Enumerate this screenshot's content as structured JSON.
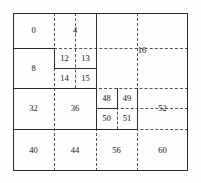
{
  "figure": {
    "bounds": {
      "x": 13,
      "y": 13,
      "width": 175,
      "height": 158
    },
    "colors": {
      "solid_line": "#2b2b2b",
      "dashed_line": "#555555",
      "background": "#fdfdfd",
      "label": "#161616"
    }
  },
  "cells": [
    {
      "label": "0",
      "x": 13,
      "y": 13,
      "w": 41,
      "h": 35
    },
    {
      "label": "4",
      "x": 54,
      "y": 13,
      "w": 42,
      "h": 35
    },
    {
      "label": "8",
      "x": 13,
      "y": 48,
      "w": 41,
      "h": 40
    },
    {
      "label": "12",
      "x": 54,
      "y": 48,
      "w": 21,
      "h": 20
    },
    {
      "label": "13",
      "x": 75,
      "y": 48,
      "w": 21,
      "h": 20
    },
    {
      "label": "14",
      "x": 54,
      "y": 68,
      "w": 21,
      "h": 20
    },
    {
      "label": "15",
      "x": 75,
      "y": 68,
      "w": 21,
      "h": 20
    },
    {
      "label": "16",
      "x": 96,
      "y": 13,
      "w": 92,
      "h": 75
    },
    {
      "label": "32",
      "x": 13,
      "y": 88,
      "w": 41,
      "h": 41
    },
    {
      "label": "36",
      "x": 54,
      "y": 88,
      "w": 42,
      "h": 41
    },
    {
      "label": "48",
      "x": 96,
      "y": 88,
      "w": 21,
      "h": 20
    },
    {
      "label": "49",
      "x": 117,
      "y": 88,
      "w": 20,
      "h": 20
    },
    {
      "label": "50",
      "x": 96,
      "y": 108,
      "w": 21,
      "h": 21
    },
    {
      "label": "51",
      "x": 117,
      "y": 108,
      "w": 20,
      "h": 21
    },
    {
      "label": "52",
      "x": 137,
      "y": 88,
      "w": 51,
      "h": 41
    },
    {
      "label": "40",
      "x": 13,
      "y": 129,
      "w": 41,
      "h": 42
    },
    {
      "label": "44",
      "x": 54,
      "y": 129,
      "w": 42,
      "h": 42
    },
    {
      "label": "56",
      "x": 96,
      "y": 129,
      "w": 41,
      "h": 42
    },
    {
      "label": "60",
      "x": 137,
      "y": 129,
      "w": 51,
      "h": 42
    }
  ],
  "dashed_lines": [
    {
      "name": "v-dash-x54-top",
      "orient": "v",
      "x": 54,
      "y": 13,
      "len": 158
    },
    {
      "name": "v-dash-x96-full",
      "orient": "v",
      "x": 96,
      "y": 13,
      "len": 158
    },
    {
      "name": "v-dash-x137-full",
      "orient": "v",
      "x": 137,
      "y": 13,
      "len": 158
    },
    {
      "name": "v-dash-x75-upper",
      "orient": "v",
      "x": 75,
      "y": 13,
      "len": 75
    },
    {
      "name": "v-dash-x117-mid",
      "orient": "v",
      "x": 117,
      "y": 88,
      "len": 41
    },
    {
      "name": "h-dash-y48-right",
      "orient": "h",
      "x": 54,
      "y": 48,
      "len": 134
    },
    {
      "name": "h-dash-y68-mid",
      "orient": "h",
      "x": 54,
      "y": 68,
      "len": 42
    },
    {
      "name": "h-dash-y88-full",
      "orient": "h",
      "x": 13,
      "y": 88,
      "len": 175
    },
    {
      "name": "h-dash-y108-mid",
      "orient": "h",
      "x": 96,
      "y": 108,
      "len": 92
    },
    {
      "name": "h-dash-y129-right",
      "orient": "h",
      "x": 96,
      "y": 129,
      "len": 92
    }
  ],
  "solid_lines": [
    {
      "name": "h-solid-y48-left",
      "orient": "h",
      "x": 13,
      "y": 48,
      "len": 41
    },
    {
      "name": "h-solid-y68-1215",
      "orient": "h",
      "x": 54,
      "y": 68,
      "len": 42
    },
    {
      "name": "h-solid-y88-left",
      "orient": "h",
      "x": 13,
      "y": 88,
      "len": 83
    },
    {
      "name": "h-solid-y108-4850",
      "orient": "h",
      "x": 96,
      "y": 108,
      "len": 21
    },
    {
      "name": "h-solid-y129-left",
      "orient": "h",
      "x": 13,
      "y": 129,
      "len": 83
    },
    {
      "name": "h-solid-y129-5051",
      "orient": "h",
      "x": 96,
      "y": 129,
      "len": 41
    },
    {
      "name": "v-solid-x54-upper",
      "orient": "v",
      "x": 54,
      "y": 48,
      "len": 20
    },
    {
      "name": "v-solid-x96-upper",
      "orient": "v",
      "x": 96,
      "y": 13,
      "len": 75
    },
    {
      "name": "v-solid-x96-lower",
      "orient": "v",
      "x": 96,
      "y": 88,
      "len": 41
    },
    {
      "name": "v-solid-x117-4850",
      "orient": "v",
      "x": 117,
      "y": 88,
      "len": 20
    },
    {
      "name": "v-solid-x137-4951",
      "orient": "v",
      "x": 137,
      "y": 88,
      "len": 41
    }
  ]
}
